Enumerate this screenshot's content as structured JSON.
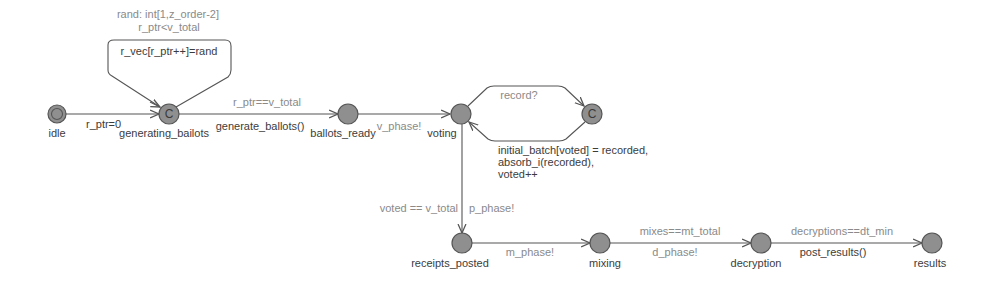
{
  "diagram": {
    "type": "timed-automaton",
    "colors": {
      "node_fill": "#8f8f8f",
      "node_stroke": "#555555",
      "edge": "#555555",
      "location_label": "#3c3c3c",
      "guard_text": "#8a8a8a",
      "update_text": "#3c3c3c"
    },
    "locations": [
      {
        "id": "idle",
        "label": "idle",
        "initial": true,
        "committed": false
      },
      {
        "id": "generating_bailots",
        "label": "generating_bailots",
        "initial": false,
        "committed": true,
        "mark": "C"
      },
      {
        "id": "ballots_ready",
        "label": "ballots_ready",
        "initial": false,
        "committed": false
      },
      {
        "id": "voting",
        "label": "voting",
        "initial": false,
        "committed": false
      },
      {
        "id": "record_committed",
        "label": "",
        "initial": false,
        "committed": true,
        "mark": "C"
      },
      {
        "id": "receipts_posted",
        "label": "receipts_posted",
        "initial": false,
        "committed": false
      },
      {
        "id": "mixing",
        "label": "mixing",
        "initial": false,
        "committed": false
      },
      {
        "id": "decryption",
        "label": "decryption",
        "initial": false,
        "committed": false
      },
      {
        "id": "results",
        "label": "results",
        "initial": false,
        "committed": false
      }
    ],
    "edges": {
      "idle_to_generating": {
        "update": "r_ptr=0"
      },
      "generating_self": {
        "select": "rand: int[1,z_order-2]",
        "guard": "r_ptr<v_total",
        "update": "r_vec[r_ptr++]=rand"
      },
      "generating_to_ready": {
        "guard": "r_ptr==v_total",
        "update": "generate_ballots()"
      },
      "ready_to_voting": {
        "sync": "v_phase!"
      },
      "voting_to_record": {
        "sync": "record?"
      },
      "record_to_voting": {
        "update_lines": [
          "initial_batch[voted] = recorded,",
          "absorb_i(recorded),",
          "voted++"
        ]
      },
      "voting_to_receipts": {
        "guard": "voted == v_total",
        "sync": "p_phase!"
      },
      "receipts_to_mixing": {
        "sync": "m_phase!"
      },
      "mixing_to_decryption": {
        "guard": "mixes==mt_total",
        "sync": "d_phase!"
      },
      "decryption_to_results": {
        "guard": "decryptions==dt_min",
        "update": "post_results()"
      }
    }
  }
}
